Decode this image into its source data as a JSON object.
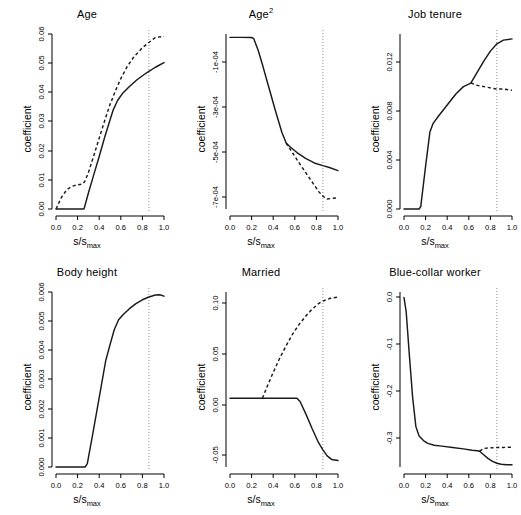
{
  "figure": {
    "layout": "2x3 grid of coefficient path plots",
    "shared_xlabel_main": "s",
    "shared_xlabel_sep": "/",
    "shared_xlabel_sub_base": "s",
    "shared_xlabel_sub": "max",
    "shared_ylabel": "coefficient",
    "xticks": [
      "0.0",
      "0.2",
      "0.4",
      "0.6",
      "0.8",
      "1.0"
    ],
    "xtick_values": [
      0.0,
      0.2,
      0.4,
      0.6,
      0.8,
      1.0
    ],
    "reference_line_x": 0.86
  },
  "chart_data": [
    {
      "type": "line",
      "title": "Age",
      "title_sup": "",
      "xlabel": "s/s_max",
      "ylabel": "coefficient",
      "xlim": [
        0.0,
        1.0
      ],
      "ylim": [
        0.0,
        0.06
      ],
      "yticks": [
        0.0,
        0.01,
        0.02,
        0.03,
        0.04,
        0.05,
        0.06
      ],
      "ytick_labels": [
        "0.00",
        "0.01",
        "0.02",
        "0.03",
        "0.04",
        "0.05",
        "0.06"
      ],
      "grid": false,
      "legend": "none",
      "reference_line_x": 0.86,
      "series": [
        {
          "name": "solid-path",
          "style": "solid",
          "x": [
            0.0,
            0.1,
            0.2,
            0.25,
            0.26,
            0.3,
            0.35,
            0.4,
            0.45,
            0.5,
            0.53,
            0.57,
            0.62,
            0.68,
            0.75,
            0.82,
            0.86,
            0.92,
            1.0
          ],
          "y": [
            0.0,
            0.0,
            0.0,
            0.0,
            0.0001,
            0.0055,
            0.0118,
            0.018,
            0.0245,
            0.0305,
            0.034,
            0.0372,
            0.0398,
            0.042,
            0.0443,
            0.0462,
            0.0472,
            0.0486,
            0.0502
          ]
        },
        {
          "name": "dashed-path",
          "style": "dashed",
          "x": [
            0.0,
            0.05,
            0.1,
            0.15,
            0.2,
            0.25,
            0.27,
            0.3,
            0.35,
            0.4,
            0.45,
            0.5,
            0.55,
            0.6,
            0.66,
            0.72,
            0.8,
            0.86,
            0.92,
            1.0
          ],
          "y": [
            0.0,
            0.004,
            0.0066,
            0.0078,
            0.0083,
            0.0086,
            0.0097,
            0.0125,
            0.0183,
            0.0243,
            0.0302,
            0.0358,
            0.0405,
            0.0447,
            0.0489,
            0.0521,
            0.0553,
            0.0571,
            0.0588,
            0.0592
          ]
        }
      ]
    },
    {
      "type": "line",
      "title": "Age",
      "title_sup": "2",
      "xlabel": "s/s_max",
      "ylabel": "coefficient",
      "xlim": [
        0.0,
        1.0
      ],
      "ylim": [
        -0.00078,
        -5e-06
      ],
      "yticks": [
        -0.0001,
        -0.0003,
        -0.0005,
        -0.0007
      ],
      "ytick_labels": [
        "-1e-04",
        "-3e-04",
        "-5e-04",
        "-7e-04"
      ],
      "grid": false,
      "legend": "none",
      "reference_line_x": 0.86,
      "series": [
        {
          "name": "solid-path",
          "style": "solid",
          "x": [
            0.0,
            0.1,
            0.2,
            0.22,
            0.26,
            0.3,
            0.36,
            0.42,
            0.48,
            0.52,
            0.55,
            0.62,
            0.7,
            0.78,
            0.86,
            0.92,
            1.0
          ],
          "y": [
            -2e-05,
            -2e-05,
            -2.05e-05,
            -2.6e-05,
            -7.6e-05,
            -0.00014,
            -0.000242,
            -0.000344,
            -0.00044,
            -0.000488,
            -0.000502,
            -0.00053,
            -0.000556,
            -0.000576,
            -0.000588,
            -0.000596,
            -0.00061
          ]
        },
        {
          "name": "dashed-path",
          "style": "dashed",
          "x": [
            0.52,
            0.58,
            0.64,
            0.7,
            0.76,
            0.82,
            0.86,
            0.9,
            0.94,
            1.0
          ],
          "y": [
            -0.000488,
            -0.000532,
            -0.000576,
            -0.000618,
            -0.00066,
            -0.000702,
            -0.000723,
            -0.000736,
            -0.000733,
            -0.00073
          ]
        }
      ]
    },
    {
      "type": "line",
      "title": "Job tenure",
      "title_sup": "",
      "xlabel": "s/s_max",
      "ylabel": "coefficient",
      "xlim": [
        0.0,
        1.0
      ],
      "ylim": [
        0.0,
        0.0143
      ],
      "yticks": [
        0.0,
        0.004,
        0.008,
        0.012
      ],
      "ytick_labels": [
        "0.000",
        "0.004",
        "0.008",
        "0.012"
      ],
      "grid": false,
      "legend": "none",
      "reference_line_x": 0.86,
      "series": [
        {
          "name": "solid-path",
          "style": "solid",
          "x": [
            0.0,
            0.08,
            0.14,
            0.155,
            0.2,
            0.24,
            0.27,
            0.32,
            0.4,
            0.48,
            0.55,
            0.6,
            0.62,
            0.68,
            0.74,
            0.8,
            0.86,
            0.92,
            1.0
          ],
          "y": [
            0.0,
            0.0,
            0.0,
            0.0002,
            0.0035,
            0.0063,
            0.007,
            0.0076,
            0.0085,
            0.0094,
            0.01,
            0.0102,
            0.0103,
            0.0112,
            0.0121,
            0.0129,
            0.0135,
            0.0138,
            0.0139
          ]
        },
        {
          "name": "dashed-path",
          "style": "dashed",
          "x": [
            0.62,
            0.68,
            0.74,
            0.8,
            0.86,
            0.92,
            1.0
          ],
          "y": [
            0.0103,
            0.0101,
            0.01,
            0.0099,
            0.0098,
            0.0098,
            0.0097
          ]
        }
      ]
    },
    {
      "type": "line",
      "title": "Body height",
      "title_sup": "",
      "xlabel": "s/s_max",
      "ylabel": "coefficient",
      "xlim": [
        0.0,
        1.0
      ],
      "ylim": [
        0.0,
        0.0063
      ],
      "yticks": [
        0.0,
        0.001,
        0.002,
        0.003,
        0.004,
        0.005,
        0.006
      ],
      "ytick_labels": [
        "0.000",
        "0.001",
        "0.002",
        "0.003",
        "0.004",
        "0.005",
        "0.006"
      ],
      "grid": false,
      "legend": "none",
      "reference_line_x": 0.86,
      "series": [
        {
          "name": "solid-path",
          "style": "solid",
          "x": [
            0.0,
            0.1,
            0.2,
            0.27,
            0.29,
            0.34,
            0.4,
            0.46,
            0.5,
            0.54,
            0.58,
            0.62,
            0.68,
            0.74,
            0.8,
            0.86,
            0.92,
            0.96,
            1.0
          ],
          "y": [
            0.0,
            0.0,
            0.0,
            0.0,
            0.00012,
            0.00118,
            0.0025,
            0.00382,
            0.0044,
            0.00495,
            0.0053,
            0.00548,
            0.0057,
            0.00588,
            0.00602,
            0.00612,
            0.00619,
            0.0062,
            0.00615
          ]
        }
      ]
    },
    {
      "type": "line",
      "title": "Married",
      "title_sup": "",
      "xlabel": "s/s_max",
      "ylabel": "coefficient",
      "xlim": [
        0.0,
        1.0
      ],
      "ylim": [
        -0.068,
        0.105
      ],
      "yticks": [
        -0.05,
        0.0,
        0.05,
        0.1
      ],
      "ytick_labels": [
        "-0.05",
        "0.00",
        "0.05",
        "0.10"
      ],
      "grid": false,
      "legend": "none",
      "reference_line_x": 0.86,
      "series": [
        {
          "name": "solid-path",
          "style": "solid",
          "x": [
            0.0,
            0.15,
            0.3,
            0.45,
            0.58,
            0.62,
            0.65,
            0.7,
            0.76,
            0.82,
            0.86,
            0.9,
            0.94,
            1.0
          ],
          "y": [
            0.0,
            0.0,
            0.0,
            0.0,
            0.0,
            0.0,
            -0.0035,
            -0.015,
            -0.03,
            -0.044,
            -0.051,
            -0.057,
            -0.0605,
            -0.0615
          ]
        },
        {
          "name": "dashed-path",
          "style": "dashed",
          "x": [
            0.3,
            0.35,
            0.4,
            0.46,
            0.52,
            0.58,
            0.64,
            0.7,
            0.76,
            0.82,
            0.86,
            0.92,
            1.0
          ],
          "y": [
            0.0,
            0.013,
            0.0255,
            0.0395,
            0.052,
            0.0635,
            0.073,
            0.081,
            0.088,
            0.0935,
            0.096,
            0.0985,
            0.1
          ]
        }
      ]
    },
    {
      "type": "line",
      "title": "Blue-collar worker",
      "title_sup": "",
      "xlabel": "s/s_max",
      "ylabel": "coefficient",
      "xlim": [
        0.0,
        1.0
      ],
      "ylim": [
        -0.365,
        0.012
      ],
      "yticks": [
        0.0,
        -0.1,
        -0.2,
        -0.3
      ],
      "ytick_labels": [
        "0.0",
        "-0.1",
        "-0.2",
        "-0.3"
      ],
      "grid": false,
      "legend": "none",
      "reference_line_x": 0.86,
      "series": [
        {
          "name": "solid-path",
          "style": "solid",
          "x": [
            0.0,
            0.02,
            0.05,
            0.08,
            0.11,
            0.14,
            0.18,
            0.22,
            0.28,
            0.35,
            0.45,
            0.55,
            0.63,
            0.68,
            0.7,
            0.74,
            0.78,
            0.82,
            0.86,
            0.9,
            0.95,
            1.0
          ],
          "y": [
            0.0,
            -0.03,
            -0.125,
            -0.215,
            -0.278,
            -0.298,
            -0.308,
            -0.314,
            -0.318,
            -0.32,
            -0.323,
            -0.326,
            -0.329,
            -0.33,
            -0.331,
            -0.339,
            -0.347,
            -0.353,
            -0.357,
            -0.359,
            -0.36,
            -0.36
          ]
        },
        {
          "name": "dashed-path",
          "style": "dashed",
          "x": [
            0.7,
            0.74,
            0.78,
            0.82,
            0.86,
            0.92,
            1.0
          ],
          "y": [
            -0.331,
            -0.325,
            -0.324,
            -0.3235,
            -0.323,
            -0.3228,
            -0.3225
          ]
        }
      ]
    }
  ]
}
